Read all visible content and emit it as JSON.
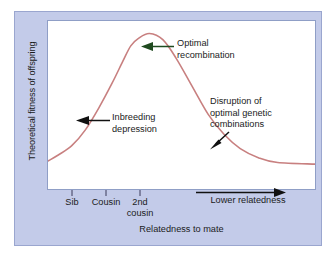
{
  "chart_data": {
    "type": "line",
    "title": "",
    "xlabel": "Relatedness to mate",
    "ylabel": "Theoretical fitness of offspring",
    "grid": false,
    "legend": false,
    "axes": {
      "x_ticks": [
        "Sib",
        "Cousin",
        "2nd cousin"
      ],
      "x_direction_label": "Lower relatedness",
      "y_ticks": []
    },
    "series": [
      {
        "name": "Theoretical fitness",
        "color": "#c88080",
        "description": "Hump-shaped curve: low at high relatedness (sib), rising to a peak near 2nd cousin, then declining and flattening at low relatedness",
        "x": [
          0,
          4,
          9,
          14,
          19,
          24,
          28,
          31,
          34,
          38,
          43,
          48,
          54,
          60,
          66,
          72,
          79,
          86,
          100
        ],
        "y": [
          18,
          22,
          28,
          38,
          52,
          68,
          82,
          92,
          97,
          100,
          96,
          84,
          66,
          48,
          35,
          26,
          20,
          17,
          16
        ]
      }
    ],
    "annotations": [
      {
        "id": "optimal",
        "lines": [
          "Optimal",
          "recombination"
        ],
        "arrow": "left-arrow",
        "arrow_color": "#1f4a1f"
      },
      {
        "id": "inbreeding",
        "lines": [
          "Inbreeding",
          "depression"
        ],
        "arrow": "left-arrow",
        "arrow_color": "#111111"
      },
      {
        "id": "disruption",
        "lines": [
          "Disruption of",
          "optimal genetic",
          "combinations"
        ],
        "arrow": "down-left-arrow",
        "arrow_color": "#111111"
      }
    ]
  },
  "colors": {
    "panel_background": "#c3cbe9",
    "plot_background": "#ffffff",
    "curve": "#c88080",
    "text": "#1b1b1b",
    "plot_border": "#8f9ec6",
    "green_arrow": "#1f4a1f"
  },
  "axis": {
    "y_title": "Theoretical fitness of offspring",
    "x_title": "Relatedness to mate",
    "ticks": [
      {
        "label_line1": "Sib",
        "label_line2": ""
      },
      {
        "label_line1": "Cousin",
        "label_line2": ""
      },
      {
        "label_line1": "2nd",
        "label_line2": "cousin"
      }
    ],
    "direction_label": "Lower relatedness"
  },
  "annotations": {
    "optimal": {
      "line1": "Optimal",
      "line2": "recombination"
    },
    "inbreeding": {
      "line1": "Inbreeding",
      "line2": "depression"
    },
    "disruption": {
      "line1": "Disruption of",
      "line2": "optimal genetic",
      "line3": "combinations"
    }
  }
}
